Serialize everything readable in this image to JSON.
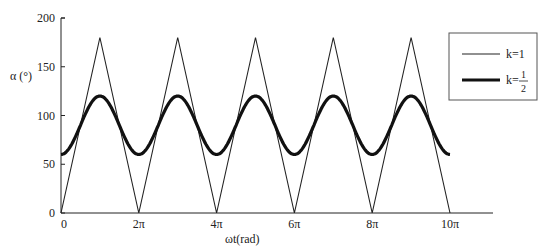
{
  "chart_data": {
    "type": "line",
    "title": "",
    "xlabel": "ωt(rad)",
    "ylabel": "α (°)",
    "xlim": [
      0,
      31.4159
    ],
    "ylim": [
      0,
      200
    ],
    "grid": false,
    "legend_position": "right",
    "x_ticks": [
      {
        "value": 0,
        "label": "0"
      },
      {
        "value": 6.2832,
        "label": "2π"
      },
      {
        "value": 12.5664,
        "label": "4π"
      },
      {
        "value": 18.8496,
        "label": "6π"
      },
      {
        "value": 25.1327,
        "label": "8π"
      },
      {
        "value": 31.4159,
        "label": "10π"
      }
    ],
    "y_ticks": [
      {
        "value": 0,
        "label": "0"
      },
      {
        "value": 50,
        "label": "50"
      },
      {
        "value": 100,
        "label": "100"
      },
      {
        "value": 150,
        "label": "150"
      },
      {
        "value": 200,
        "label": "200"
      }
    ],
    "series": [
      {
        "name": "k=1",
        "style": "thin",
        "description": "triangle wave between 0 and 180, period 2π, zeros at multiples of 2π, peaks at odd multiples of π",
        "x": [
          0,
          3.1416,
          6.2832,
          9.4248,
          12.5664,
          15.708,
          18.8496,
          21.9911,
          25.1327,
          28.2743,
          31.4159
        ],
        "values": [
          0,
          180,
          0,
          180,
          0,
          180,
          0,
          180,
          0,
          180,
          0
        ]
      },
      {
        "name": "k=1/2",
        "style": "thick",
        "description": "smooth periodic curve between 60 and 120, period 2π, minima at multiples of 2π, maxima at odd multiples of π",
        "x": [
          0,
          3.1416,
          6.2832,
          9.4248,
          12.5664,
          15.708,
          18.8496,
          21.9911,
          25.1327,
          28.2743,
          31.4159
        ],
        "values": [
          60,
          120,
          60,
          120,
          60,
          120,
          60,
          120,
          60,
          120,
          60
        ]
      }
    ]
  },
  "legend": {
    "items": [
      {
        "label": "k=1"
      },
      {
        "label_prefix": "k=",
        "numerator": "1",
        "denominator": "2"
      }
    ]
  }
}
